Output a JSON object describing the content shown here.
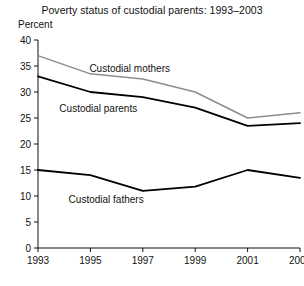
{
  "chart_data": {
    "type": "line",
    "title": "Poverty status of custodial parents: 1993–2003",
    "ylabel": "Percent",
    "xlabel": "",
    "ylim": [
      0,
      40
    ],
    "yticks": [
      0,
      5,
      10,
      15,
      20,
      25,
      30,
      35,
      40
    ],
    "xlim": [
      1993,
      2003
    ],
    "xticks": [
      1993,
      1995,
      1997,
      1999,
      2001,
      2003
    ],
    "xtick_labels": [
      "1993",
      "1995",
      "1997",
      "1999",
      "2001",
      "2003"
    ],
    "grid": false,
    "legend": "inline-labels",
    "x": [
      1993,
      1995,
      1997,
      1999,
      2001,
      2003
    ],
    "series": [
      {
        "name": "Custodial mothers",
        "color": "#8c8c8c",
        "values": [
          37.0,
          33.5,
          32.5,
          30.0,
          25.0,
          26.0
        ],
        "label_x": 1996.5,
        "label_y": 33.8
      },
      {
        "name": "Custodial parents",
        "color": "#000000",
        "values": [
          33.0,
          30.0,
          29.0,
          27.0,
          23.5,
          24.0
        ],
        "label_x": 1995.3,
        "label_y": 26.2
      },
      {
        "name": "Custodial fathers",
        "color": "#000000",
        "values": [
          15.0,
          14.0,
          11.0,
          11.8,
          15.0,
          13.5
        ],
        "label_x": 1995.6,
        "label_y": 8.6
      }
    ]
  },
  "axis": {
    "ytick_labels": [
      "0",
      "5",
      "10",
      "15",
      "20",
      "25",
      "30",
      "35",
      "40"
    ]
  }
}
